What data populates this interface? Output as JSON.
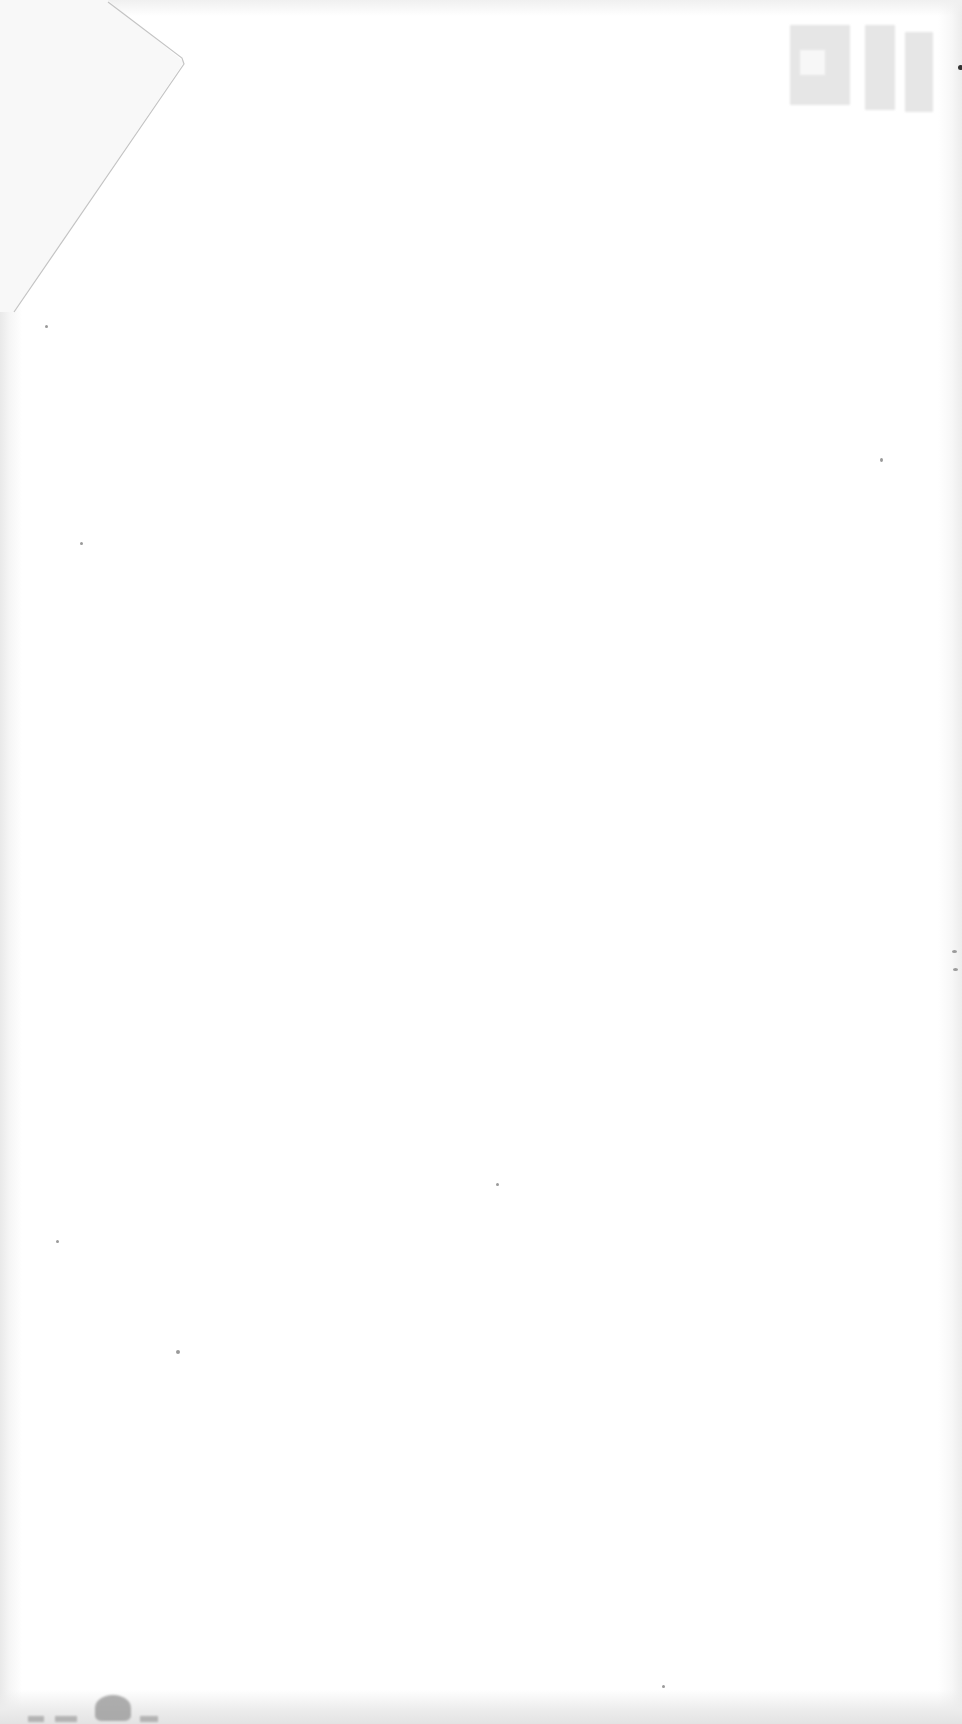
{
  "document": {
    "type": "blank scanned page",
    "visible_text": "",
    "features": [
      {
        "name": "folded-corner",
        "position": "top-left"
      },
      {
        "name": "bleed-through-stamp",
        "position": "top-right",
        "legible": false
      },
      {
        "name": "scan-smudge",
        "position": "bottom-left"
      }
    ]
  },
  "colors": {
    "paper": "#ffffff",
    "fold_line": "#c8c8c8",
    "stamp_gray": "#d3d3d3",
    "smudge_gray": "#9b9b9b"
  }
}
